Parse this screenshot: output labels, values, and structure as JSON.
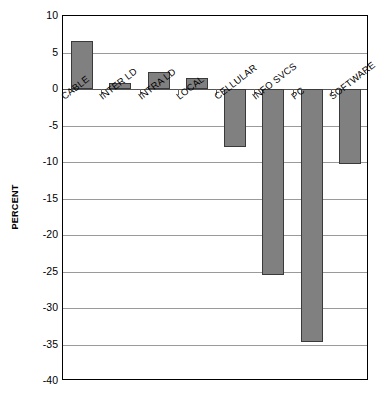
{
  "chart_data": {
    "type": "bar",
    "title": "",
    "subtitle": "",
    "xlabel": "",
    "ylabel": "PERCENT",
    "ylim": [
      -40,
      10
    ],
    "ytick_values": [
      10,
      5,
      0,
      -5,
      -10,
      -15,
      -20,
      -25,
      -30,
      -35,
      -40
    ],
    "ytick_labels": [
      "10",
      "5",
      "0",
      "-5",
      "-10",
      "-15",
      "-20",
      "-25",
      "-30",
      "-35",
      "-40"
    ],
    "grid": true,
    "legend": false,
    "legend_position": "none",
    "bar_color": "#808080",
    "bar_edge_color": "#3a3a3a",
    "categories": [
      "CABLE",
      "INTER LD",
      "INTRA LD",
      "LOCAL",
      "CELLULAR",
      "INFO SVCS",
      "PC",
      "SOFTWARE"
    ],
    "values": [
      6.6,
      0.8,
      2.3,
      1.5,
      -8.0,
      -25.5,
      -34.7,
      -10.3
    ]
  }
}
